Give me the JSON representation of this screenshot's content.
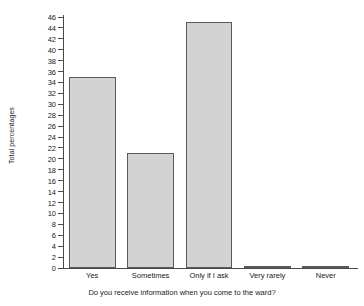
{
  "chart_data": {
    "type": "bar",
    "title": "",
    "subtitle": "",
    "xlabel": "Do you receive information when you come to the ward?",
    "ylabel": "Total  percentages",
    "categories": [
      "Yes",
      "Sometimes",
      "Only if I ask",
      "Very rarely",
      "Never"
    ],
    "values": [
      35,
      21,
      45,
      0.4,
      0.4
    ],
    "series": [
      {
        "name": "Total percentages",
        "values": [
          35,
          21,
          45,
          0.4,
          0.4
        ]
      }
    ],
    "ylim": [
      0,
      46
    ],
    "ytick_step": 2,
    "yticks": [
      0,
      2,
      4,
      6,
      8,
      10,
      12,
      14,
      16,
      18,
      20,
      22,
      24,
      26,
      28,
      30,
      32,
      34,
      36,
      38,
      40,
      42,
      44,
      46
    ],
    "ytick_labels": [
      "0",
      "2",
      "4",
      "6",
      "8",
      "10",
      "12",
      "14",
      "16",
      "18",
      "20",
      "22",
      "24",
      "26",
      "28",
      "30",
      "32",
      "34",
      "36",
      "38",
      "40",
      "42",
      "44",
      "46"
    ],
    "grid": false,
    "legend": false,
    "legend_position": "none",
    "orientation": "vertical",
    "bar_color": "#d3d3d3",
    "bar_edge_color": "#5a5a5a",
    "axis_color": "#4a4a4a",
    "background": "#ffffff"
  }
}
